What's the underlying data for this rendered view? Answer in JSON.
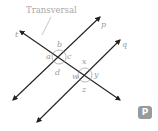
{
  "diagram": {
    "title": "Transversal",
    "lines": {
      "p": "p",
      "q": "q",
      "t": "t"
    },
    "angles_at_p": [
      "a",
      "b",
      "c",
      "d"
    ],
    "angles_at_q": [
      "w",
      "x",
      "y",
      "z"
    ],
    "labels": {
      "a": "a",
      "b": "b",
      "c": "c",
      "d": "d",
      "w": "w",
      "x": "x",
      "y": "y",
      "z": "z"
    },
    "colors": {
      "line": "#222222",
      "label": "#9a9a9a",
      "arc": "#8a8a8a",
      "badge": "#9a9a9a"
    }
  },
  "badge": {
    "label": "P"
  }
}
